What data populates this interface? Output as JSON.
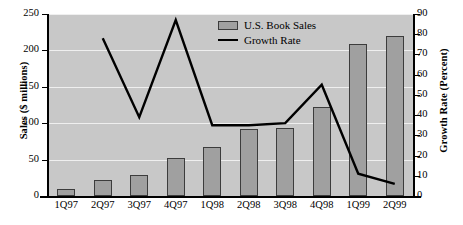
{
  "chart_data": {
    "type": "bar",
    "title": "",
    "categories": [
      "1Q97",
      "2Q97",
      "3Q97",
      "4Q97",
      "1Q98",
      "2Q98",
      "3Q98",
      "4Q98",
      "1Q99",
      "2Q99"
    ],
    "series": [
      {
        "name": "U.S. Book Sales",
        "type": "bar",
        "axis": "left",
        "values": [
          10,
          22,
          29,
          52,
          68,
          92,
          93,
          122,
          209,
          220
        ]
      },
      {
        "name": "Growth Rate",
        "type": "line",
        "axis": "right",
        "values": [
          null,
          78,
          39,
          87,
          35,
          35,
          36,
          55,
          11,
          6
        ]
      }
    ],
    "xlabel": "",
    "ylabel": "Sales ($ millions)",
    "ylabel_right": "Growth Rate (Percent)",
    "ylim": [
      0,
      250
    ],
    "ylim_right": [
      0,
      90
    ],
    "yticks": [
      0,
      50,
      100,
      150,
      200,
      250
    ],
    "yticks_right": [
      0,
      10,
      20,
      30,
      40,
      50,
      60,
      70,
      80,
      90
    ],
    "grid": true,
    "legend_position": "top-center",
    "plot_background": "#c8c8c8",
    "bar_color": "#a0a0a0",
    "bar_edge_color": "#3c3c3c",
    "line_color": "#000000",
    "grid_color": "#efefef"
  },
  "axes": {
    "left_title": "Sales ($ millions)",
    "right_title": "Growth Rate (Percent)",
    "left_ticks": [
      "250",
      "200",
      "150",
      "100",
      "50",
      "0"
    ],
    "right_ticks": [
      "90",
      "80",
      "70",
      "60",
      "50",
      "40",
      "30",
      "20",
      "10",
      "0"
    ],
    "x_ticks": [
      "1Q97",
      "2Q97",
      "3Q97",
      "4Q97",
      "1Q98",
      "2Q98",
      "3Q98",
      "4Q98",
      "1Q99",
      "2Q99"
    ]
  },
  "legend": {
    "items": [
      {
        "label": "U.S. Book Sales",
        "marker": "bar-swatch-icon"
      },
      {
        "label": "Growth Rate",
        "marker": "line-swatch-icon"
      }
    ]
  }
}
